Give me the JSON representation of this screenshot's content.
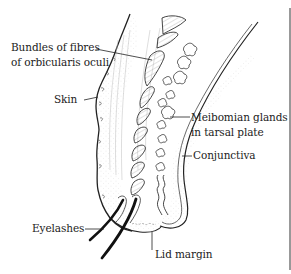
{
  "figure": {
    "labels": {
      "bundles_line1": "Bundles of fibres",
      "bundles_line2": "of orbicularis oculi",
      "skin": "Skin",
      "meibomian_line1": "Meibomian glands",
      "meibomian_line2": "in tarsal plate",
      "conjunctiva": "Conjunctiva",
      "eyelashes": "Eyelashes",
      "lid_margin": "Lid margin"
    },
    "colors": {
      "ink": "#222222",
      "hatch": "#8a8a8a",
      "background": "#ffffff"
    }
  }
}
